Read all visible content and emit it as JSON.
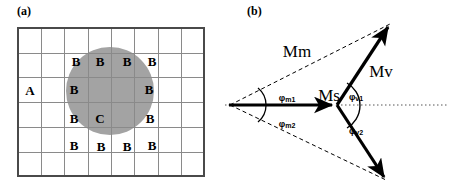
{
  "figure": {
    "panels": [
      {
        "id": "a",
        "label": "(a)"
      },
      {
        "id": "b",
        "label": "(b)"
      }
    ]
  },
  "panel_a": {
    "label": "(a)",
    "grid": {
      "columns": 8,
      "rows": 6,
      "line_color": "#888888",
      "border_color": "#555555"
    },
    "circle": {
      "fill_color": "#a3a3a3",
      "center_x": 110,
      "center_y": 91,
      "radius": 44
    },
    "region_labels": {
      "outside": "A",
      "boundary": "B",
      "center": "C"
    },
    "labels": [
      {
        "text": "B",
        "x": 76,
        "y": 61
      },
      {
        "text": "B",
        "x": 100,
        "y": 61
      },
      {
        "text": "B",
        "x": 127,
        "y": 61
      },
      {
        "text": "B",
        "x": 152,
        "y": 61
      },
      {
        "text": "A",
        "x": 30,
        "y": 90
      },
      {
        "text": "B",
        "x": 74,
        "y": 89
      },
      {
        "text": "B",
        "x": 149,
        "y": 89
      },
      {
        "text": "B",
        "x": 74,
        "y": 118
      },
      {
        "text": "C",
        "x": 100,
        "y": 118
      },
      {
        "text": "B",
        "x": 150,
        "y": 118
      },
      {
        "text": "B",
        "x": 74,
        "y": 145
      },
      {
        "text": "B",
        "x": 101,
        "y": 146
      },
      {
        "text": "B",
        "x": 127,
        "y": 146
      },
      {
        "text": "B",
        "x": 152,
        "y": 145
      }
    ]
  },
  "panel_b": {
    "label": "(b)",
    "vectors": [
      {
        "name": "Ms",
        "label": "Ms",
        "style": "solid",
        "from": "origin",
        "to": "junction"
      },
      {
        "name": "Mv",
        "label": "Mv",
        "style": "solid",
        "from": "junction",
        "to": "upper_tip"
      },
      {
        "name": "Mv2",
        "label": "",
        "style": "solid",
        "from": "junction",
        "to": "lower_tip"
      },
      {
        "name": "Mm",
        "label": "Mm",
        "style": "dashed",
        "from": "origin",
        "to": "upper_tip"
      },
      {
        "name": "Mm2",
        "label": "",
        "style": "dashed",
        "from": "origin",
        "to": "lower_tip"
      }
    ],
    "vector_labels": [
      {
        "text": "Mm",
        "x": 72,
        "y": 52
      },
      {
        "text": "Ms",
        "x": 104,
        "y": 96
      },
      {
        "text": "Mv",
        "x": 156,
        "y": 72
      }
    ],
    "angle_labels": [
      {
        "base": "φ",
        "sub": "m1",
        "x": 62,
        "y": 98
      },
      {
        "base": "φ",
        "sub": "m2",
        "x": 62,
        "y": 124
      },
      {
        "base": "φ",
        "sub": "v1",
        "x": 131,
        "y": 97
      },
      {
        "base": "φ",
        "sub": "v2",
        "x": 131,
        "y": 131
      }
    ],
    "reference_line": {
      "style": "dotted",
      "description": "horizontal reference axis"
    },
    "geometry": {
      "origin_x": 3,
      "origin_y": 105,
      "junction_x": 112,
      "junction_y": 105,
      "upper_tip_x": 167,
      "upper_tip_y": 22,
      "lower_tip_x": 163,
      "lower_tip_y": 182
    },
    "colors": {
      "stroke": "#000000"
    }
  }
}
